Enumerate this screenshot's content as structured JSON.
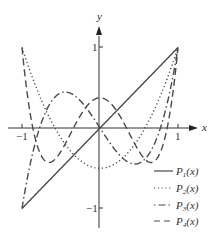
{
  "chart_data": {
    "type": "line",
    "title": "",
    "xlabel": "x",
    "ylabel": "y",
    "xlim": [
      -1,
      1
    ],
    "ylim": [
      -1,
      1
    ],
    "x_ticks": [
      "-1",
      "1"
    ],
    "y_ticks": [
      "1",
      "-1"
    ],
    "grid": false,
    "legend_position": "lower right",
    "series": [
      {
        "name": "P1(x)",
        "label_base": "P",
        "label_sub": "1",
        "label_arg": "(x)",
        "style": "solid",
        "formula": "x",
        "x": [
          -1,
          -0.5,
          0,
          0.5,
          1
        ],
        "values": [
          -1,
          -0.5,
          0,
          0.5,
          1
        ]
      },
      {
        "name": "P2(x)",
        "label_base": "P",
        "label_sub": "2",
        "label_arg": "(x)",
        "style": "dotted",
        "formula": "(3x^2-1)/2",
        "x": [
          -1,
          -0.5,
          0,
          0.5,
          1
        ],
        "values": [
          1,
          -0.125,
          -0.5,
          -0.125,
          1
        ]
      },
      {
        "name": "P3(x)",
        "label_base": "P",
        "label_sub": "3",
        "label_arg": "(x)",
        "style": "dash-dot",
        "formula": "(5x^3-3x)/2",
        "x": [
          -1,
          -0.5,
          0,
          0.5,
          1
        ],
        "values": [
          -1,
          0.4375,
          0,
          -0.4375,
          1
        ]
      },
      {
        "name": "P4(x)",
        "label_base": "P",
        "label_sub": "4",
        "label_arg": "(x)",
        "style": "dashed",
        "formula": "(35x^4-30x^2+3)/8",
        "x": [
          -1,
          -0.5,
          0,
          0.5,
          1
        ],
        "values": [
          1,
          -0.2891,
          0.375,
          -0.2891,
          1
        ]
      }
    ]
  },
  "axes": {
    "x_label": "x",
    "y_label": "y",
    "x_tick_neg": "−1",
    "x_tick_pos": "1",
    "y_tick_pos": "1",
    "y_tick_neg": "−1"
  },
  "colors": {
    "line": "#4a4a4a",
    "axis": "#333333"
  }
}
